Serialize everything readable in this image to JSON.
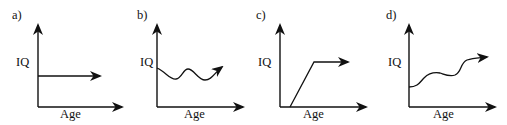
{
  "figure": {
    "panels": [
      {
        "label": "a)",
        "y_axis": "IQ",
        "x_axis": "Age",
        "curve": "constant horizontal line"
      },
      {
        "label": "b)",
        "y_axis": "IQ",
        "x_axis": "Age",
        "curve": "wavy line fluctuating around a constant level"
      },
      {
        "label": "c)",
        "y_axis": "IQ",
        "x_axis": "Age",
        "curve": "starts at zero, rises linearly, then plateaus"
      },
      {
        "label": "d)",
        "y_axis": "IQ",
        "x_axis": "Age",
        "curve": "wavy line with overall increasing trend"
      }
    ]
  }
}
